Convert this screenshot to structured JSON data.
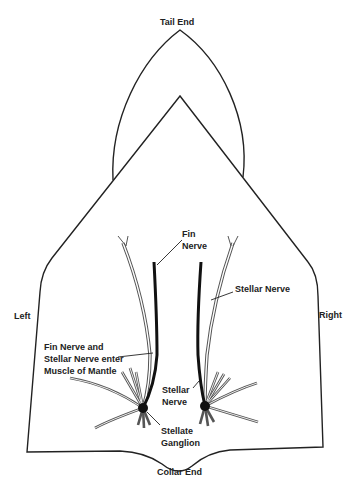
{
  "diagram": {
    "labels": {
      "tail_end": "Tail End",
      "collar_end": "Collar End",
      "left": "Left",
      "right": "Right",
      "fin_nerve_line1": "Fin",
      "fin_nerve_line2": "Nerve",
      "stellar_nerve_right": "Stellar Nerve",
      "enter_line1": "Fin Nerve and",
      "enter_line2": "Stellar Nerve enter",
      "enter_line3": "Muscle of Mantle",
      "stellar_nerve_line1": "Stellar",
      "stellar_nerve_line2": "Nerve",
      "ganglion_line1": "Stellate",
      "ganglion_line2": "Ganglion"
    },
    "colors": {
      "outline": "#222222",
      "nerve_dark": "#111111",
      "nerve_double": "#555555",
      "background": "#ffffff"
    }
  }
}
